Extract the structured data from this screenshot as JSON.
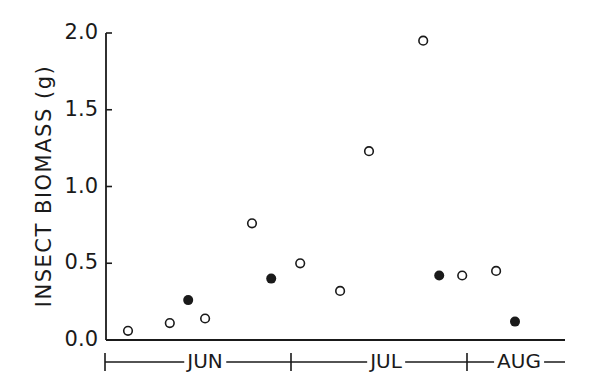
{
  "chart_data": {
    "type": "scatter",
    "title": "",
    "xlabel": "",
    "ylabel": "INSECT BIOMASS  (g)",
    "ylim": [
      0,
      2.0
    ],
    "yticks": [
      0.0,
      0.5,
      1.0,
      1.5,
      2.0
    ],
    "ytick_labels": [
      "0.0",
      "0.5",
      "1.0",
      "1.5",
      "2.0"
    ],
    "x_month_labels": [
      "JUN",
      "JUL",
      "AUG"
    ],
    "grid": false,
    "legend": null,
    "series": [
      {
        "name": "open circles",
        "marker": "open-circle",
        "points": [
          {
            "month": "JUN",
            "x_frac": 0.048,
            "y": 0.06
          },
          {
            "month": "JUN",
            "x_frac": 0.139,
            "y": 0.11
          },
          {
            "month": "JUN",
            "x_frac": 0.216,
            "y": 0.14
          },
          {
            "month": "JUN",
            "x_frac": 0.318,
            "y": 0.76
          },
          {
            "month": "JUL",
            "x_frac": 0.423,
            "y": 0.5
          },
          {
            "month": "JUL",
            "x_frac": 0.51,
            "y": 0.32
          },
          {
            "month": "JUL",
            "x_frac": 0.573,
            "y": 1.23
          },
          {
            "month": "JUL",
            "x_frac": 0.691,
            "y": 1.95
          },
          {
            "month": "AUG",
            "x_frac": 0.776,
            "y": 0.42
          },
          {
            "month": "AUG",
            "x_frac": 0.85,
            "y": 0.45
          }
        ]
      },
      {
        "name": "filled circles",
        "marker": "filled-circle",
        "points": [
          {
            "month": "JUN",
            "x_frac": 0.179,
            "y": 0.26
          },
          {
            "month": "JUN",
            "x_frac": 0.36,
            "y": 0.4
          },
          {
            "month": "JUL",
            "x_frac": 0.726,
            "y": 0.42
          },
          {
            "month": "AUG",
            "x_frac": 0.891,
            "y": 0.12
          }
        ]
      }
    ]
  },
  "layout": {
    "plot_left": 106,
    "plot_right": 565,
    "plot_top": 33,
    "plot_bottom": 340,
    "month_bar_y": 362,
    "month_bounds_px": [
      105,
      291,
      467,
      565
    ],
    "month_label_x": [
      205,
      386,
      519
    ]
  }
}
